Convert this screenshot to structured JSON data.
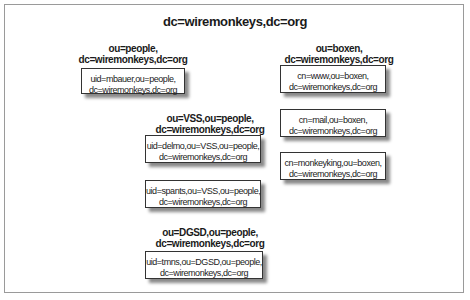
{
  "diagram": {
    "root": "dc=wiremonkeys,dc=org",
    "ous": [
      {
        "line1": "ou=people,",
        "line2": "dc=wiremonkeys,dc=org"
      },
      {
        "line1": "ou=boxen,",
        "line2": "dc=wiremonkeys,dc=org"
      },
      {
        "line1": "ou=VSS,ou=people,",
        "line2": "dc=wiremonkeys,dc=org"
      },
      {
        "line1": "ou=DGSD,ou=people,",
        "line2": "dc=wiremonkeys,dc=org"
      }
    ],
    "entries": [
      {
        "line1": "uid=mbauer,ou=people,",
        "line2": "dc=wiremonkeys,dc=org"
      },
      {
        "line1": "cn=www,ou=boxen,",
        "line2": "dc=wiremonkeys,dc=org"
      },
      {
        "line1": "cn=mail,ou=boxen,",
        "line2": "dc=wiremonkeys,dc=org"
      },
      {
        "line1": "cn=monkeyking,ou=boxen,",
        "line2": "dc=wiremonkeys,dc=org"
      },
      {
        "line1": "uid=delmo,ou=VSS,ou=people,",
        "line2": "dc=wiremonkeys,dc=org"
      },
      {
        "line1": "uid=spants,ou=VSS,ou=people,",
        "line2": "dc=wiremonkeys,dc=org"
      },
      {
        "line1": "uid=tmns,ou=DGSD,ou=people,",
        "line2": "dc=wiremonkeys,dc=org"
      }
    ]
  }
}
